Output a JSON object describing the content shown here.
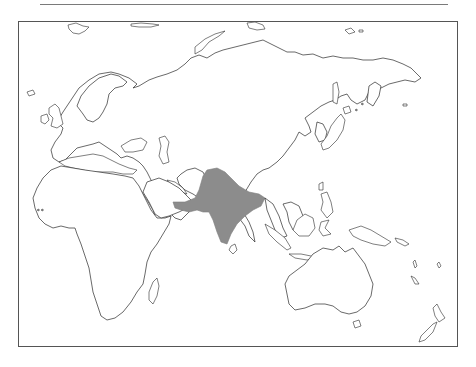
{
  "map": {
    "type": "outline-map",
    "region_shown": "Eastern Hemisphere (Europe, Africa, Asia, Oceania)",
    "highlighted_region": {
      "name": "South Asia / Indian subcontinent",
      "fill_color": "#8c8c8c"
    },
    "colors": {
      "land_fill": "#ffffff",
      "coastline": "#2a2a2a",
      "frame_border": "#555555",
      "top_rule": "#7a7a7a"
    }
  }
}
